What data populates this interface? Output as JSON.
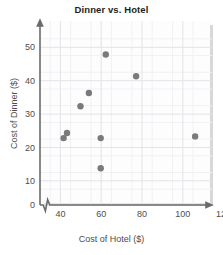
{
  "chart_data": {
    "type": "scatter",
    "title": "Dinner vs. Hotel",
    "xlabel": "Cost of Hotel ($)",
    "ylabel": "Cost of Dinner ($)",
    "xlim": [
      33,
      135
    ],
    "ylim": [
      0,
      55
    ],
    "axis_break_x": true,
    "grid": true,
    "grid_minor": true,
    "legend": "none",
    "marker_color": "#7a7a7a",
    "xticks": [
      40,
      60,
      80,
      100,
      120
    ],
    "yticks": [
      0,
      10,
      20,
      30,
      40,
      50
    ],
    "xtick_labels": [
      "40",
      "60",
      "80",
      "100",
      "120"
    ],
    "ytick_labels": [
      "0",
      "10",
      "20",
      "30",
      "40",
      "50"
    ],
    "points": [
      {
        "x": 47,
        "y": 20.0
      },
      {
        "x": 49,
        "y": 21.5
      },
      {
        "x": 57,
        "y": 29.5
      },
      {
        "x": 62,
        "y": 33.5
      },
      {
        "x": 69,
        "y": 20.0
      },
      {
        "x": 69,
        "y": 11.0
      },
      {
        "x": 72,
        "y": 45.0
      },
      {
        "x": 90,
        "y": 38.5
      },
      {
        "x": 125,
        "y": 20.5
      }
    ],
    "series": [
      {
        "name": "Dinner vs. Hotel",
        "x": [
          47,
          49,
          57,
          62,
          69,
          69,
          72,
          90,
          125
        ],
        "values": [
          20.0,
          21.5,
          29.5,
          33.5,
          20.0,
          11.0,
          45.0,
          38.5,
          20.5
        ]
      }
    ]
  },
  "colors": {
    "marker": "#7a7a7a",
    "axis": "#6b6b6b",
    "grid_major": "#e3e3e8",
    "grid_minor": "#f1f1f4",
    "title_text": "#231f20",
    "label_text": "#4d4d4d",
    "panel": "#fdfdfd"
  }
}
